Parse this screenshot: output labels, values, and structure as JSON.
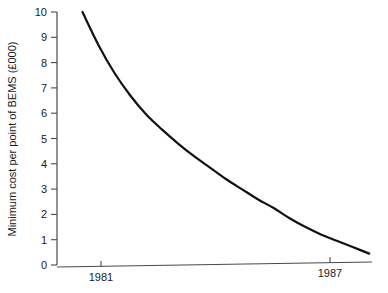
{
  "chart_data": {
    "type": "line",
    "title": "",
    "subtitle": "",
    "xlabel": "",
    "ylabel": "Minimum cost per point of BEMS (£000)",
    "xlim": [
      1979.2,
      1989.4
    ],
    "ylim": [
      0,
      10
    ],
    "grid": false,
    "legend": null,
    "y_ticks": [
      0,
      1,
      2,
      3,
      4,
      5,
      6,
      7,
      8,
      9,
      10
    ],
    "y_tick_labels": [
      "0",
      "1",
      "2",
      "3",
      "4",
      "5",
      "6",
      "7",
      "8",
      "9",
      "10"
    ],
    "x_ticks": [
      1981,
      1987
    ],
    "x_tick_labels": [
      "1981",
      "1987"
    ],
    "series": [
      {
        "name": "Minimum cost per point of BEMS",
        "x": [
          1980.0,
          1980.5,
          1981.0,
          1981.5,
          1982.0,
          1982.5,
          1983.0,
          1983.5,
          1984.0,
          1984.5,
          1985.0,
          1985.5,
          1986.0,
          1986.5,
          1987.0,
          1987.5,
          1988.0,
          1988.5,
          1989.0
        ],
        "values": [
          10.0,
          8.7,
          7.6,
          6.7,
          5.95,
          5.35,
          4.8,
          4.3,
          3.85,
          3.4,
          3.0,
          2.6,
          2.25,
          1.85,
          1.5,
          1.2,
          0.95,
          0.7,
          0.45
        ]
      }
    ],
    "annotations": [],
    "colors": {
      "curve": "#111111",
      "axis": "#4a4a4a",
      "text": "#1a1a1a",
      "background": "#ffffff"
    }
  }
}
